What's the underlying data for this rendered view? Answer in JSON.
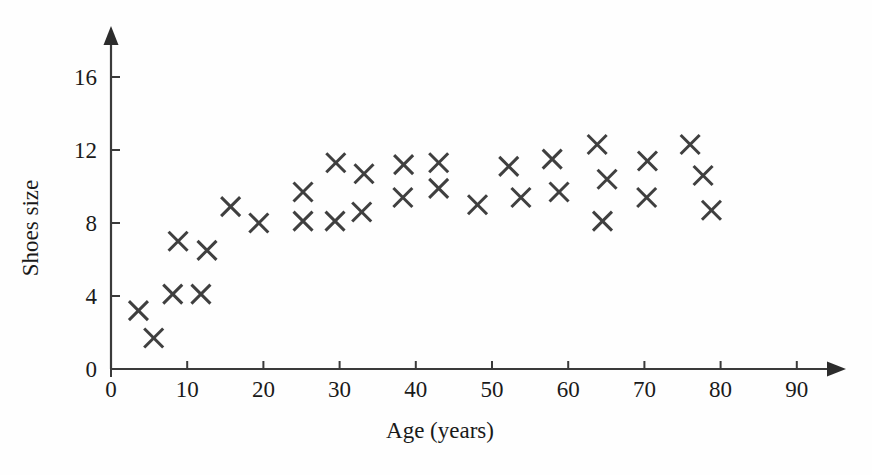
{
  "chart_data": {
    "type": "scatter",
    "title": "",
    "xlabel": "Age (years)",
    "ylabel": "Shoes size",
    "xlim": [
      0,
      97
    ],
    "ylim": [
      0,
      18.5
    ],
    "xticks": [
      0,
      10,
      20,
      30,
      40,
      50,
      60,
      70,
      80,
      90
    ],
    "xtick_labels": [
      "0",
      "10",
      "20",
      "30",
      "40",
      "50",
      "60",
      "70",
      "80",
      "90"
    ],
    "yticks": [
      0,
      4,
      8,
      12,
      16
    ],
    "ytick_labels": [
      "0",
      "4",
      "8",
      "12",
      "16"
    ],
    "grid": false,
    "legend": null,
    "marker": "x",
    "marker_color": "#3f3f3f",
    "axis_color": "#3a3a3a",
    "background_color": "#fefefe",
    "x_axis_arrow": true,
    "y_axis_arrow": true,
    "points": [
      {
        "x": 3.6,
        "y": 3.2
      },
      {
        "x": 5.6,
        "y": 1.7
      },
      {
        "x": 8.1,
        "y": 4.1
      },
      {
        "x": 8.8,
        "y": 7.0
      },
      {
        "x": 11.8,
        "y": 4.1
      },
      {
        "x": 12.6,
        "y": 6.5
      },
      {
        "x": 15.7,
        "y": 8.9
      },
      {
        "x": 19.4,
        "y": 8.0
      },
      {
        "x": 25.2,
        "y": 9.7
      },
      {
        "x": 25.2,
        "y": 8.1
      },
      {
        "x": 29.5,
        "y": 11.3
      },
      {
        "x": 29.4,
        "y": 8.1
      },
      {
        "x": 32.9,
        "y": 8.6
      },
      {
        "x": 33.2,
        "y": 10.7
      },
      {
        "x": 38.4,
        "y": 11.2
      },
      {
        "x": 38.3,
        "y": 9.4
      },
      {
        "x": 43.0,
        "y": 11.3
      },
      {
        "x": 43.0,
        "y": 9.9
      },
      {
        "x": 48.1,
        "y": 9.0
      },
      {
        "x": 52.2,
        "y": 11.1
      },
      {
        "x": 53.8,
        "y": 9.4
      },
      {
        "x": 57.9,
        "y": 11.5
      },
      {
        "x": 58.8,
        "y": 9.7
      },
      {
        "x": 63.8,
        "y": 12.3
      },
      {
        "x": 65.1,
        "y": 10.4
      },
      {
        "x": 64.5,
        "y": 8.1
      },
      {
        "x": 70.4,
        "y": 11.4
      },
      {
        "x": 70.3,
        "y": 9.4
      },
      {
        "x": 76.0,
        "y": 12.3
      },
      {
        "x": 77.7,
        "y": 10.6
      },
      {
        "x": 78.8,
        "y": 8.7
      }
    ]
  }
}
